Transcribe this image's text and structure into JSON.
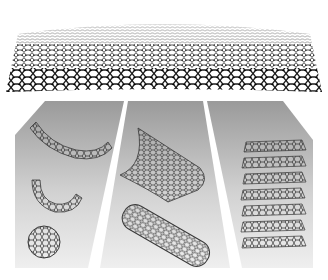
{
  "figure": {
    "colors": {
      "background": "#ffffff",
      "sheet_atoms": "#1a1a1a",
      "panel_top": "#9a9a9a",
      "panel_bottom": "#eeeeee",
      "molecule_lines": "#3a3a3a"
    },
    "top_sheet": {
      "name": "graphene-sheet"
    },
    "panels": [
      {
        "name": "fullerene-panel",
        "items": [
          "graphene-fragment-curved",
          "partial-fullerene-cage",
          "buckyball"
        ]
      },
      {
        "name": "nanotube-panel",
        "items": [
          "rolling-sheet",
          "carbon-nanotube"
        ]
      },
      {
        "name": "graphite-panel",
        "items": [
          "stacked-graphene-layers"
        ],
        "layer_count": 7
      }
    ]
  }
}
